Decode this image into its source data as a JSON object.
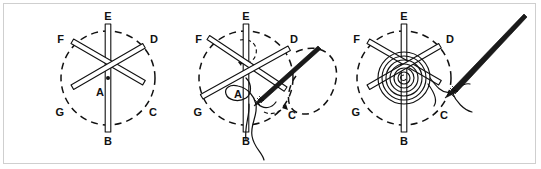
{
  "figure": {
    "title": "Woven Spider Web Stitch",
    "border_color": "#cfcfcf",
    "background_color": "#ffffff",
    "ink_color": "#111111",
    "width": 541,
    "height": 169
  },
  "panels": [
    {
      "id": "panel-1",
      "caption": "Foundation spokes",
      "center_label": "A",
      "labels": [
        {
          "key": "E",
          "text": "E",
          "position": "top"
        },
        {
          "key": "D",
          "text": "D",
          "position": "upper-right"
        },
        {
          "key": "C",
          "text": "C",
          "position": "lower-right"
        },
        {
          "key": "B",
          "text": "B",
          "position": "bottom"
        },
        {
          "key": "G",
          "text": "G",
          "position": "lower-left"
        },
        {
          "key": "F",
          "text": "F",
          "position": "upper-left"
        },
        {
          "key": "A",
          "text": "A",
          "position": "center"
        }
      ],
      "spoke_count": 6,
      "has_dashed_circle": true,
      "has_needle": false,
      "has_weave": false,
      "has_direction_arrow": false
    },
    {
      "id": "panel-2",
      "caption": "Beginning the weave",
      "center_label": "A",
      "labels": [
        {
          "key": "E",
          "text": "E",
          "position": "top"
        },
        {
          "key": "D",
          "text": "D",
          "position": "upper-right"
        },
        {
          "key": "C",
          "text": "C",
          "position": "lower-right"
        },
        {
          "key": "B",
          "text": "B",
          "position": "bottom"
        },
        {
          "key": "G",
          "text": "G",
          "position": "lower-left"
        },
        {
          "key": "F",
          "text": "F",
          "position": "upper-left"
        },
        {
          "key": "A",
          "text": "A",
          "position": "center"
        }
      ],
      "spoke_count": 6,
      "has_dashed_circle": true,
      "has_needle": true,
      "has_weave": false,
      "has_direction_arrow": true
    },
    {
      "id": "panel-3",
      "caption": "Completed woven wheel",
      "center_label": "",
      "labels": [
        {
          "key": "E",
          "text": "E",
          "position": "top"
        },
        {
          "key": "D",
          "text": "D",
          "position": "upper-right"
        },
        {
          "key": "C",
          "text": "C",
          "position": "lower-right"
        },
        {
          "key": "B",
          "text": "B",
          "position": "bottom"
        },
        {
          "key": "G",
          "text": "G",
          "position": "lower-left"
        },
        {
          "key": "F",
          "text": "F",
          "position": "upper-left"
        }
      ],
      "spoke_count": 6,
      "has_dashed_circle": true,
      "has_needle": true,
      "has_weave": true,
      "weave_rings": 6,
      "has_direction_arrow": false
    }
  ]
}
